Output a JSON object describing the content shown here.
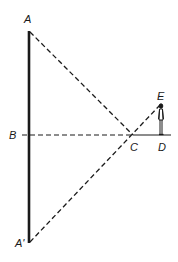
{
  "diagram": {
    "colors": {
      "ink": "#1a1a1a",
      "background": "#ffffff"
    },
    "points": {
      "A": {
        "label": "A",
        "x": 29,
        "y": 31
      },
      "B": {
        "label": "B",
        "x": 29,
        "y": 135
      },
      "A_prime": {
        "label": "A'",
        "x": 29,
        "y": 243
      },
      "C": {
        "label": "C",
        "x": 133,
        "y": 135
      },
      "D": {
        "label": "D",
        "x": 161,
        "y": 135
      },
      "E": {
        "label": "E",
        "x": 161,
        "y": 104
      }
    },
    "labels": {
      "A": "A",
      "B": "B",
      "A_prime": "A'",
      "C": "C",
      "D": "D",
      "E": "E"
    },
    "segments": [
      {
        "from": "A",
        "to": "A_prime",
        "style": "solid-thick"
      },
      {
        "from": "A",
        "to": "C",
        "style": "dashed"
      },
      {
        "from": "A_prime",
        "to": "E",
        "style": "dashed"
      },
      {
        "from": "B",
        "to": "C",
        "style": "dashed"
      },
      {
        "from": "C",
        "to": "D",
        "style": "solid-thin"
      }
    ],
    "figure": {
      "name": "observer",
      "at": "D",
      "height_to": "E"
    }
  }
}
